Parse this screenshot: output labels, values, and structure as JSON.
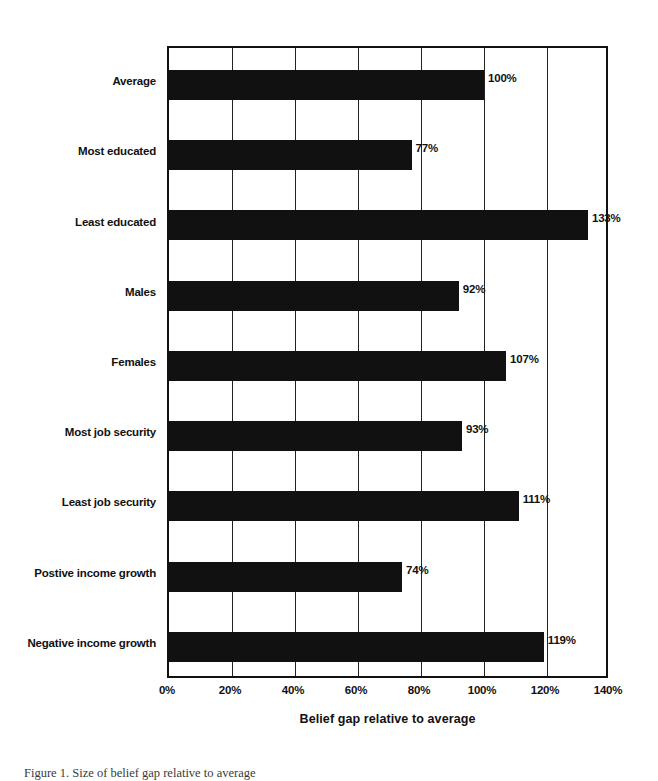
{
  "chart_data": {
    "type": "bar",
    "orientation": "horizontal",
    "title": "",
    "xlabel": "Belief gap relative to average",
    "ylabel": "",
    "xlim": [
      0,
      140
    ],
    "xticks": [
      "0%",
      "20%",
      "40%",
      "60%",
      "80%",
      "100%",
      "120%",
      "140%"
    ],
    "xtick_values": [
      0,
      20,
      40,
      60,
      80,
      100,
      120,
      140
    ],
    "grid": "vertical",
    "legend": null,
    "units": "percent",
    "categories": [
      "Average",
      "Most educated",
      "Least educated",
      "Males",
      "Females",
      "Most job security",
      "Least job security",
      "Postive income growth",
      "Negative income growth"
    ],
    "values": [
      100,
      77,
      133,
      92,
      107,
      93,
      111,
      74,
      119
    ],
    "data_labels": [
      "100%",
      "77%",
      "133%",
      "92%",
      "107%",
      "93%",
      "111%",
      "74%",
      "119%"
    ],
    "bar_color": "#111111",
    "background_color": "#ffffff"
  },
  "figure": {
    "caption": "Figure 1.  Size of belief gap relative to average"
  }
}
